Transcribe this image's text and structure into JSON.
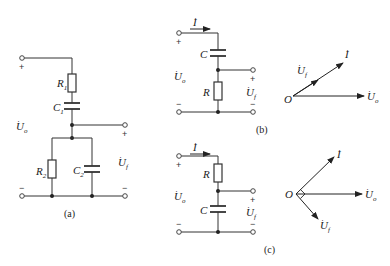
{
  "figure": {
    "panels": [
      {
        "id": "a",
        "caption": "(a)",
        "components": {
          "R1": {
            "sym": "R",
            "sub": "1"
          },
          "C1": {
            "sym": "C",
            "sub": "1"
          },
          "R2": {
            "sym": "R",
            "sub": "2"
          },
          "C2": {
            "sym": "C",
            "sub": "2"
          }
        },
        "input_label": {
          "sym": "U",
          "sub": "o"
        },
        "output_label": {
          "sym": "U",
          "sub": "f"
        },
        "plus": "+",
        "minus": "−"
      },
      {
        "id": "b",
        "caption": "(b)",
        "current_label": "I",
        "components": {
          "C": {
            "sym": "C"
          },
          "R": {
            "sym": "R"
          }
        },
        "input_label": {
          "sym": "U",
          "sub": "o"
        },
        "output_label": {
          "sym": "U",
          "sub": "f"
        },
        "phasor": {
          "origin": "O",
          "vectors": [
            {
              "name": "I",
              "angle_deg": 35
            },
            {
              "name": "Uf",
              "label_sym": "U",
              "label_sub": "f",
              "angle_deg": 35
            },
            {
              "name": "Uo",
              "label_sym": "U",
              "label_sub": "o",
              "angle_deg": 0
            }
          ]
        },
        "plus": "+",
        "minus": "−"
      },
      {
        "id": "c",
        "caption": "(c)",
        "current_label": "I",
        "components": {
          "R": {
            "sym": "R"
          },
          "C": {
            "sym": "C"
          }
        },
        "input_label": {
          "sym": "U",
          "sub": "o"
        },
        "output_label": {
          "sym": "U",
          "sub": "f"
        },
        "phasor": {
          "origin": "O",
          "vectors": [
            {
              "name": "I",
              "angle_deg": 40
            },
            {
              "name": "Uo",
              "label_sym": "U",
              "label_sub": "o",
              "angle_deg": 0
            },
            {
              "name": "Uf",
              "label_sym": "U",
              "label_sub": "f",
              "angle_deg": -50
            }
          ],
          "right_angle_marker": true
        },
        "plus": "+",
        "minus": "−"
      }
    ]
  }
}
